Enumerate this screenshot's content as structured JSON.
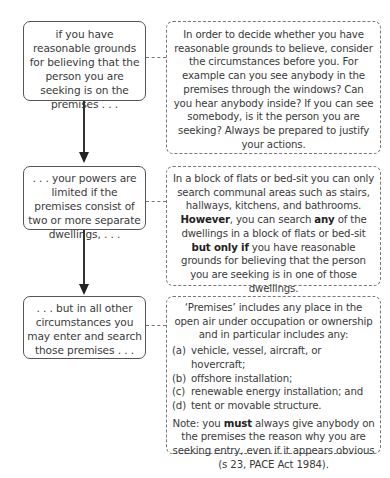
{
  "flow": [
    {
      "condition": "if you have reasonable grounds for believing that the person you are seeking is on the premises . . .",
      "explanation": "In order to decide whether you have reasonable grounds to believe, consider the circumstances before you. For example can you see anybody in the premises through the windows? Can you  hear anybody inside? If you can see somebody, is it the person you are seeking? Always be prepared to justify your actions."
    },
    {
      "condition": ". . . your powers are limited if the premises consist of two or more separate dwellings, . . .",
      "explanation": {
        "part1": "In a block of flats or bed-sit you can only search communal areas such as stairs, hallways, kitchens, and bathrooms. ",
        "bold1": "However",
        "part2": ", you can search ",
        "bold2": "any",
        "part3": " of the dwellings in a block of flats or bed-sit ",
        "bold3": "but only if",
        "part4": " you have reasonable grounds for believing that the person you are seeking is in one of those dwellings."
      }
    },
    {
      "condition": ". . . but in all other circumstances you may enter and search those premises . . .",
      "explanation": {
        "intro": "‘Premises’ includes any place in the open air under occupation or ownership and in particular includes any:",
        "list": [
          {
            "label": "(a)",
            "text": "vehicle, vessel, aircraft, or hovercraft;"
          },
          {
            "label": "(b)",
            "text": "offshore installation;"
          },
          {
            "label": "(c)",
            "text": "renewable energy installation; and"
          },
          {
            "label": "(d)",
            "text": "tent or movable structure."
          }
        ],
        "note_prefix": "Note: you ",
        "note_bold": "must",
        "note_rest": " always give anybody on the premises the reason why you are seeking entry, even if it appears obvious (s 23, PACE Act 1984)."
      }
    }
  ]
}
